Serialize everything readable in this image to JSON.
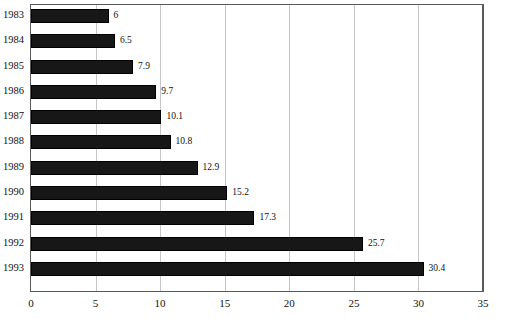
{
  "chart_data": {
    "type": "bar",
    "orientation": "horizontal",
    "title": "",
    "xlabel": "",
    "ylabel": "",
    "categories": [
      "1983",
      "1984",
      "1985",
      "1986",
      "1987",
      "1988",
      "1989",
      "1990",
      "1991",
      "1992",
      "1993"
    ],
    "values": [
      6,
      6.5,
      7.9,
      9.7,
      10.1,
      10.8,
      12.9,
      15.2,
      17.3,
      25.7,
      30.4
    ],
    "value_labels": [
      "6",
      "6.5",
      "7.9",
      "9.7",
      "10.1",
      "10.8",
      "12.9",
      "15.2",
      "17.3",
      "25.7",
      "30.4"
    ],
    "xlim": [
      0,
      35
    ],
    "xticks": [
      0,
      5,
      10,
      15,
      20,
      25,
      30,
      35
    ],
    "xtick_labels": [
      "0",
      "5",
      "10",
      "15",
      "20",
      "25",
      "30",
      "35"
    ],
    "grid": "vertical",
    "legend": "none",
    "bar_color": "#171717",
    "gridline_color": "#c6c6c6",
    "axis_color": "#5a5a5a",
    "background_color": "#ffffff",
    "data_labels_shown": true
  }
}
